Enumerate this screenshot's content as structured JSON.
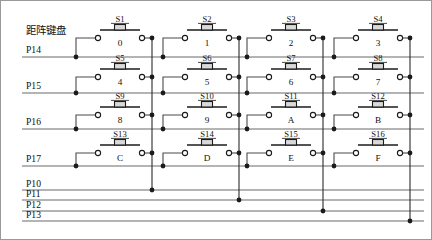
{
  "diagram": {
    "title": "距阵键盘",
    "type": "4x4 matrix keypad schematic",
    "row_ports": [
      {
        "name": "P14",
        "y": 57
      },
      {
        "name": "P15",
        "y": 93
      },
      {
        "name": "P16",
        "y": 129
      },
      {
        "name": "P17",
        "y": 166
      }
    ],
    "column_ports": [
      {
        "name": "P10",
        "y": 190
      },
      {
        "name": "P11",
        "y": 200
      },
      {
        "name": "P12",
        "y": 211
      },
      {
        "name": "P13",
        "y": 221
      }
    ],
    "columns": [
      {
        "index": 0,
        "x": 152,
        "port": "P10"
      },
      {
        "index": 1,
        "x": 239,
        "port": "P11"
      },
      {
        "index": 2,
        "x": 323,
        "port": "P12"
      },
      {
        "index": 3,
        "x": 410,
        "port": "P13"
      }
    ],
    "switches": [
      {
        "ref": "S1",
        "key": "0",
        "row": 0,
        "col": 0,
        "cx": 120,
        "cy": 38
      },
      {
        "ref": "S2",
        "key": "1",
        "row": 0,
        "col": 1,
        "cx": 207,
        "cy": 38
      },
      {
        "ref": "S3",
        "key": "2",
        "row": 0,
        "col": 2,
        "cx": 291,
        "cy": 38
      },
      {
        "ref": "S4",
        "key": "3",
        "row": 0,
        "col": 3,
        "cx": 378,
        "cy": 38
      },
      {
        "ref": "S5",
        "key": "4",
        "row": 1,
        "col": 0,
        "cx": 120,
        "cy": 77
      },
      {
        "ref": "S6",
        "key": "5",
        "row": 1,
        "col": 1,
        "cx": 207,
        "cy": 77
      },
      {
        "ref": "S7",
        "key": "6",
        "row": 1,
        "col": 2,
        "cx": 291,
        "cy": 77
      },
      {
        "ref": "S8",
        "key": "7",
        "row": 1,
        "col": 3,
        "cx": 378,
        "cy": 77
      },
      {
        "ref": "S9",
        "key": "8",
        "row": 2,
        "col": 0,
        "cx": 120,
        "cy": 115
      },
      {
        "ref": "S10",
        "key": "9",
        "row": 2,
        "col": 1,
        "cx": 207,
        "cy": 115
      },
      {
        "ref": "S11",
        "key": "A",
        "row": 2,
        "col": 2,
        "cx": 291,
        "cy": 115
      },
      {
        "ref": "S12",
        "key": "B",
        "row": 2,
        "col": 3,
        "cx": 378,
        "cy": 115
      },
      {
        "ref": "S13",
        "key": "C",
        "row": 3,
        "col": 0,
        "cx": 120,
        "cy": 153
      },
      {
        "ref": "S14",
        "key": "D",
        "row": 3,
        "col": 1,
        "cx": 207,
        "cy": 153
      },
      {
        "ref": "S15",
        "key": "E",
        "row": 3,
        "col": 2,
        "cx": 291,
        "cy": 153
      },
      {
        "ref": "S16",
        "key": "F",
        "row": 3,
        "col": 3,
        "cx": 378,
        "cy": 153
      }
    ]
  }
}
